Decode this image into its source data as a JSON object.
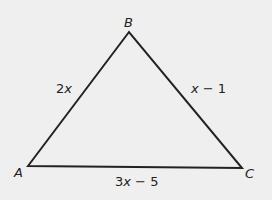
{
  "diagram": {
    "type": "triangle",
    "background": "#efefef",
    "stroke": "#222222",
    "vertices": {
      "A": {
        "label": "A",
        "x": 28,
        "y": 166
      },
      "B": {
        "label": "B",
        "x": 129,
        "y": 32
      },
      "C": {
        "label": "C",
        "x": 242,
        "y": 168
      }
    },
    "sides": {
      "AB": {
        "label_coef": "2",
        "label_var": "x",
        "label_rest": ""
      },
      "BC": {
        "label_coef": "",
        "label_var": "x",
        "label_rest": " − 1"
      },
      "AC": {
        "label_coef": "3",
        "label_var": "x",
        "label_rest": " − 5"
      }
    }
  }
}
